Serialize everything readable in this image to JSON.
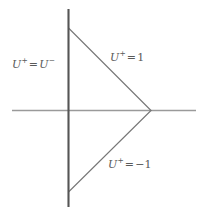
{
  "figure": {
    "background_color": "#ffffff"
  },
  "axes": {
    "horizontal": {
      "name": "horizontal-axis",
      "color": "#9a9a9a",
      "x1": 12,
      "y1": 110.5,
      "x2": 196,
      "y2": 110.5,
      "width": 1.6
    },
    "vertical": {
      "name": "vertical-axis",
      "color": "#555555",
      "x1": 68.5,
      "y1": 9,
      "x2": 68.5,
      "y2": 207,
      "width": 2.1
    }
  },
  "rays": [
    {
      "id": "upper-ray",
      "color": "#777777",
      "width": 1.1,
      "x1": 68.5,
      "y1": 28,
      "x2": 151,
      "y2": 110.5
    },
    {
      "id": "lower-ray",
      "color": "#777777",
      "width": 1.1,
      "x1": 151,
      "y1": 110.5,
      "x2": 68.5,
      "y2": 192
    }
  ],
  "labels": {
    "left": {
      "symbol": "U",
      "sup_left": "+",
      "operator": "=",
      "symbol2": "U",
      "sup_right": "−",
      "text": "U+=U−"
    },
    "upper": {
      "symbol": "U",
      "sup": "+",
      "operator": "=",
      "value": "1",
      "text": "U+=1"
    },
    "lower": {
      "symbol": "U",
      "sup": "+",
      "operator": "=",
      "value": "−1",
      "text": "U+=−1"
    }
  },
  "colors": {
    "line_dark": "#555555",
    "line_medium": "#777777",
    "line_light": "#9a9a9a",
    "text": "#5a5a5a"
  }
}
